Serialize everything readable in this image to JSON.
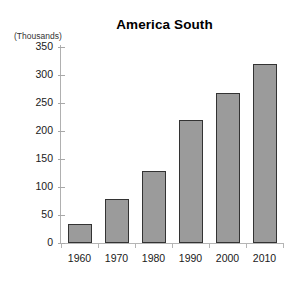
{
  "chart_data": {
    "type": "bar",
    "title": "America South",
    "units_caption": "(Thousands)",
    "xlabel": "",
    "ylabel": "",
    "categories": [
      "1960",
      "1970",
      "1980",
      "1990",
      "2000",
      "2010"
    ],
    "values": [
      34,
      78,
      128,
      220,
      267,
      320
    ],
    "series": [
      {
        "name": "America South",
        "values": [
          34,
          78,
          128,
          220,
          267,
          320
        ]
      }
    ],
    "ylim": [
      0,
      350
    ],
    "ytick_labels": [
      "0",
      "50",
      "100",
      "150",
      "200",
      "250",
      "300",
      "350"
    ],
    "ytick_values": [
      0,
      50,
      100,
      150,
      200,
      250,
      300,
      350
    ],
    "grid": false,
    "legend": "none",
    "bar_fill_color": "#9b9b9b",
    "bar_border_color": "#333333",
    "background_color": "#ffffff",
    "axis_color": "#b0b0b0"
  }
}
